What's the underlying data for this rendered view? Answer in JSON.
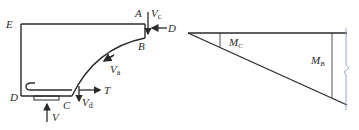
{
  "left_diagram": {
    "title": "Free body of bracket / corbel",
    "points": {
      "A": "A",
      "B": "B",
      "C": "C",
      "D": "D",
      "E": "E"
    },
    "forces": {
      "Vc": {
        "main": "V",
        "sub": "c"
      },
      "D_force": "D",
      "Va": {
        "main": "V",
        "sub": "a"
      },
      "T": "T",
      "Vd": {
        "main": "V",
        "sub": "d"
      },
      "V": "V"
    }
  },
  "right_diagram": {
    "title": "Moment diagram",
    "labels": {
      "MC": {
        "main": "M",
        "sub": "C"
      },
      "MB": {
        "main": "M",
        "sub": "B"
      }
    }
  },
  "colors": {
    "line": "#2a2a2a",
    "break_line": "#8a9ad0"
  }
}
